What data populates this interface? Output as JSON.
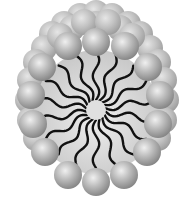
{
  "diagram": {
    "head_group_count_front_ring": 14,
    "tail_count": 18,
    "colors": {
      "background": "#ffffff",
      "head_light": "#e8e8e8",
      "head_mid": "#b4b4b4",
      "head_dark": "#8a8a8a",
      "interior": "#d6d6d6",
      "tail": "#111111",
      "core": "#e2e2e2"
    }
  }
}
